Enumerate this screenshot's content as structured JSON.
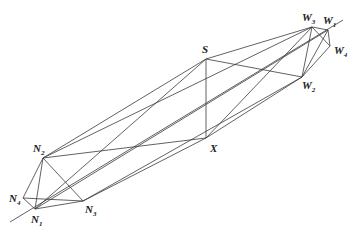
{
  "diagram": {
    "type": "geometric-network",
    "points": {
      "N1": {
        "label": "N",
        "sub": "1",
        "x": 35,
        "y": 209
      },
      "N2": {
        "label": "N",
        "sub": "2",
        "x": 43,
        "y": 158
      },
      "N3": {
        "label": "N",
        "sub": "3",
        "x": 83,
        "y": 201
      },
      "N4": {
        "label": "N",
        "sub": "4",
        "x": 23,
        "y": 198
      },
      "S": {
        "label": "S",
        "sub": "",
        "x": 206,
        "y": 59
      },
      "X": {
        "label": "X",
        "sub": "",
        "x": 206,
        "y": 138
      },
      "W1": {
        "label": "W",
        "sub": "1",
        "x": 328,
        "y": 30
      },
      "W2": {
        "label": "W",
        "sub": "2",
        "x": 302,
        "y": 77
      },
      "W3": {
        "label": "W",
        "sub": "3",
        "x": 312,
        "y": 27
      },
      "W4": {
        "label": "W",
        "sub": "4",
        "x": 330,
        "y": 46
      }
    },
    "axis_line": {
      "from": [
        10,
        222
      ],
      "to": [
        343,
        20
      ]
    },
    "edges": [
      [
        "N1",
        "N2"
      ],
      [
        "N1",
        "N3"
      ],
      [
        "N1",
        "N4"
      ],
      [
        "N2",
        "N3"
      ],
      [
        "N2",
        "N4"
      ],
      [
        "N3",
        "N4"
      ],
      [
        "W1",
        "W2"
      ],
      [
        "W1",
        "W3"
      ],
      [
        "W1",
        "W4"
      ],
      [
        "W2",
        "W3"
      ],
      [
        "W2",
        "W4"
      ],
      [
        "W3",
        "W4"
      ],
      [
        "S",
        "X"
      ],
      [
        "N2",
        "S"
      ],
      [
        "N2",
        "X"
      ],
      [
        "N1",
        "S"
      ],
      [
        "N3",
        "X"
      ],
      [
        "S",
        "W3"
      ],
      [
        "S",
        "W2"
      ],
      [
        "X",
        "W2"
      ],
      [
        "X",
        "W3"
      ],
      [
        "N2",
        "W3"
      ],
      [
        "N3",
        "W2"
      ],
      [
        "N1",
        "W1"
      ]
    ]
  }
}
